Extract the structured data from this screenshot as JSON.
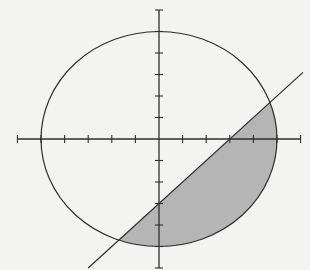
{
  "diagram": {
    "type": "coordinate-plane",
    "colors": {
      "background": "#f3f3f2",
      "stroke": "#2e2e2e",
      "shade": "#b5b5b5"
    },
    "axes": {
      "x_range": [
        -6,
        6
      ],
      "y_range": [
        -6,
        6
      ],
      "tick_step": 1,
      "labels_shown": false
    },
    "circle": {
      "center": [
        0,
        0
      ],
      "radius": 5,
      "equation": "x^2 + y^2 = 25"
    },
    "line": {
      "slope": 1,
      "intercept": -3,
      "equation": "y = x - 3",
      "x_range": [
        -3,
        6.1
      ]
    },
    "shaded_region": {
      "description": "Region inside circle and below line y = x - 3",
      "intersections": [
        [
          4.7,
          1.7
        ],
        [
          -1.7,
          -4.7
        ]
      ]
    }
  }
}
